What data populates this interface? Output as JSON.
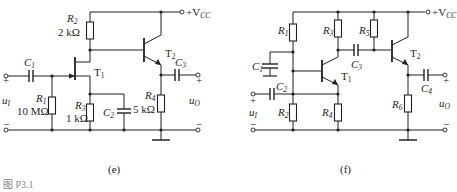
{
  "figure_caption": "图 P3.1",
  "circuit_e": {
    "label": "(e)",
    "supply": "+V",
    "supply_sub": "CC",
    "input": {
      "name": "u",
      "sub": "I"
    },
    "output": {
      "name": "u",
      "sub": "O"
    },
    "components": {
      "C1": {
        "name": "C",
        "sub": "1"
      },
      "C2": {
        "name": "C",
        "sub": "2"
      },
      "C3": {
        "name": "C",
        "sub": "3"
      },
      "R1": {
        "name": "R",
        "sub": "1",
        "value": "10 MΩ"
      },
      "R2": {
        "name": "R",
        "sub": "2",
        "value": "2 kΩ"
      },
      "R3": {
        "name": "R",
        "sub": "3",
        "value": "1 kΩ"
      },
      "R4": {
        "name": "R",
        "sub": "4",
        "value": "5 kΩ"
      },
      "T1": {
        "name": "T",
        "sub": "1"
      },
      "T2": {
        "name": "T",
        "sub": "2"
      }
    }
  },
  "circuit_f": {
    "label": "(f)",
    "supply": "+V",
    "supply_sub": "CC",
    "input": {
      "name": "u",
      "sub": "I"
    },
    "output": {
      "name": "u",
      "sub": "O"
    },
    "components": {
      "C1": {
        "name": "C",
        "sub": "1"
      },
      "C2": {
        "name": "C",
        "sub": "2"
      },
      "C3": {
        "name": "C",
        "sub": "3"
      },
      "C4": {
        "name": "C",
        "sub": "4"
      },
      "R1": {
        "name": "R",
        "sub": "1"
      },
      "R2": {
        "name": "R",
        "sub": "2"
      },
      "R3": {
        "name": "R",
        "sub": "3"
      },
      "R4": {
        "name": "R",
        "sub": "4"
      },
      "R5": {
        "name": "R",
        "sub": "5"
      },
      "R6": {
        "name": "R",
        "sub": "6"
      },
      "T1": {
        "name": "T",
        "sub": "1"
      },
      "T2": {
        "name": "T",
        "sub": "2"
      }
    }
  }
}
